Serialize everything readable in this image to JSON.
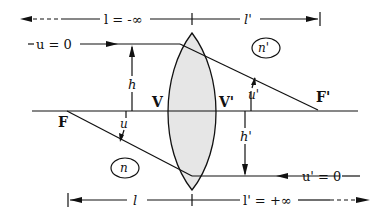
{
  "diagram": {
    "labels": {
      "top_left": "l = -∞",
      "top_right": "l'",
      "bottom_left": "l",
      "bottom_right": "l' = +∞",
      "u_in": "u = 0",
      "u_out": "u' = 0",
      "h": "h",
      "h_prime": "h'",
      "u": "u",
      "u_prime": "u'",
      "vertex": "V",
      "vertex_prime": "V'",
      "focus": "F",
      "focus_prime": "F'",
      "n": "n",
      "n_prime": "n'"
    },
    "colors": {
      "line": "#111111",
      "lens_fill": "#e6e6e6",
      "background": "#ffffff"
    }
  }
}
